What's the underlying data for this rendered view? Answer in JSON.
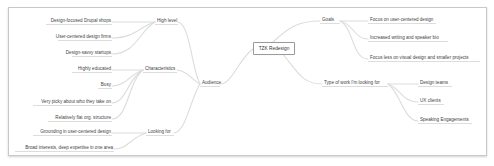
{
  "mindmap": {
    "root": "TZK Redesign",
    "left": {
      "audience": {
        "label": "Audience",
        "high_level": {
          "label": "High level",
          "children": [
            "Design-focused Drupal shops",
            "User-centered design firms",
            "Design-savvy startups"
          ]
        },
        "characteristics": {
          "label": "Characteristics",
          "children": [
            "Highly educated",
            "Busy",
            "Very picky about who they take on",
            "Relatively flat org. structure"
          ]
        },
        "looking_for": {
          "label": "Looking for",
          "children": [
            "Grounding in user-centered design",
            "Broad interests, deep expertise in one area"
          ]
        }
      }
    },
    "right": {
      "goals": {
        "label": "Goals",
        "children": [
          "Focus on user-centered design",
          "Increased writing and speaker bio",
          "Focus less on visual design and smaller projects"
        ]
      },
      "type_of_work": {
        "label": "Type of work I'm looking for",
        "children": [
          "Design teams",
          "UX clients",
          "Speaking Engagements"
        ]
      }
    },
    "colors": {
      "link": "#dcdcdc",
      "underline": "#cfcfcf",
      "text": "#444444",
      "frame": "#c9c9c9"
    }
  }
}
